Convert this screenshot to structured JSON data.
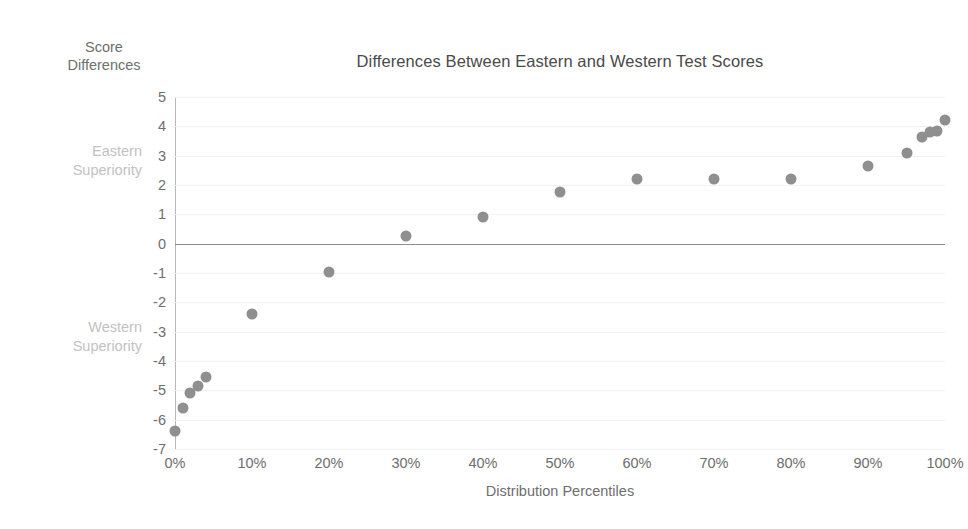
{
  "chart_data": {
    "type": "scatter",
    "title": "Differences Between Eastern and Western Test Scores",
    "xlabel": "Distribution Percentiles",
    "ylabel": "Score Differences",
    "xlim": [
      0,
      100
    ],
    "ylim": [
      -7,
      5
    ],
    "grid": true,
    "legend": "none",
    "x_tick_labels": [
      "0%",
      "10%",
      "20%",
      "30%",
      "40%",
      "50%",
      "60%",
      "70%",
      "80%",
      "90%",
      "100%"
    ],
    "x_tick_values": [
      0,
      10,
      20,
      30,
      40,
      50,
      60,
      70,
      80,
      90,
      100
    ],
    "y_tick_labels": [
      "5",
      "4",
      "3",
      "2",
      "1",
      "0",
      "-1",
      "-2",
      "-3",
      "-4",
      "-5",
      "-6",
      "-7"
    ],
    "y_tick_values": [
      5,
      4,
      3,
      2,
      1,
      0,
      -1,
      -2,
      -3,
      -4,
      -5,
      -6,
      -7
    ],
    "zero_line": 0,
    "series": [
      {
        "name": "Score difference by percentile",
        "x": [
          0,
          1,
          2,
          3,
          4,
          10,
          20,
          30,
          40,
          50,
          60,
          70,
          80,
          90,
          95,
          97,
          98,
          99,
          100
        ],
        "values": [
          -6.4,
          -5.6,
          -5.1,
          -4.85,
          -4.55,
          -2.4,
          -0.95,
          0.25,
          0.9,
          1.75,
          2.2,
          2.2,
          2.2,
          2.65,
          3.1,
          3.65,
          3.8,
          3.85,
          4.2
        ]
      }
    ],
    "annotations": [
      {
        "id": "eastern",
        "lines": [
          "Eastern",
          "Superiority"
        ],
        "y_value": 2.6
      },
      {
        "id": "western",
        "lines": [
          "Western",
          "Superiority"
        ],
        "y_value": -3.4
      }
    ],
    "colors": {
      "marker": "#8f8f8f",
      "gridline": "#f2f2f2",
      "zero_line": "#8d8d8d",
      "axis_line": "#b7b7b7",
      "tick_text": "#6e6e6e",
      "title_text": "#4a4a4a",
      "annotation_text": "#c2c2c2",
      "background": "#ffffff"
    }
  },
  "annotations": {
    "eastern_line1": "Eastern",
    "eastern_line2": "Superiority",
    "western_line1": "Western",
    "western_line2": "Superiority"
  },
  "axis_titles": {
    "y_line1": "Score",
    "y_line2": "Differences",
    "x": "Distribution Percentiles"
  },
  "title": "Differences Between Eastern and Western Test Scores"
}
